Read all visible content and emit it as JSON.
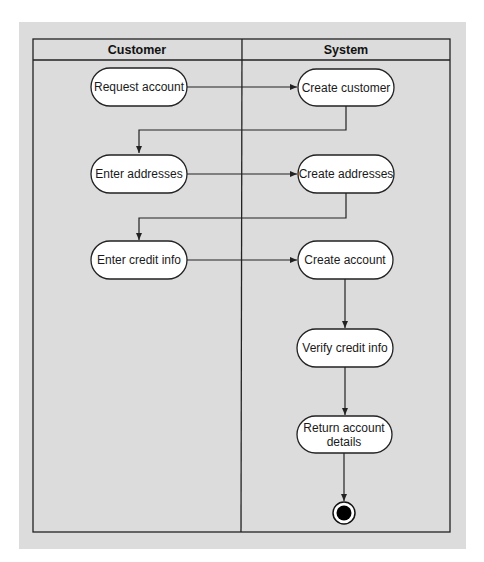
{
  "diagram": {
    "type": "UML activity diagram (swimlanes)",
    "colors": {
      "background": "#dcdcdc",
      "line": "#222222",
      "node_fill": "#ffffff",
      "final_node": "#000000"
    },
    "lanes": [
      {
        "id": "customer",
        "title": "Customer"
      },
      {
        "id": "system",
        "title": "System"
      }
    ],
    "nodes": [
      {
        "id": "request_account",
        "lane": "customer",
        "lines": [
          "Request account"
        ]
      },
      {
        "id": "create_customer",
        "lane": "system",
        "lines": [
          "Create customer"
        ]
      },
      {
        "id": "enter_addresses",
        "lane": "customer",
        "lines": [
          "Enter addresses"
        ]
      },
      {
        "id": "create_addresses",
        "lane": "system",
        "lines": [
          "Create addresses"
        ]
      },
      {
        "id": "enter_credit_info",
        "lane": "customer",
        "lines": [
          "Enter credit info"
        ]
      },
      {
        "id": "create_account",
        "lane": "system",
        "lines": [
          "Create account"
        ]
      },
      {
        "id": "verify_credit_info",
        "lane": "system",
        "lines": [
          "Verify credit info"
        ]
      },
      {
        "id": "return_account_details",
        "lane": "system",
        "lines": [
          "Return account",
          "details"
        ]
      },
      {
        "id": "final",
        "lane": "system",
        "type": "final-node"
      }
    ],
    "edges": [
      [
        "request_account",
        "create_customer"
      ],
      [
        "create_customer",
        "enter_addresses"
      ],
      [
        "enter_addresses",
        "create_addresses"
      ],
      [
        "create_addresses",
        "enter_credit_info"
      ],
      [
        "enter_credit_info",
        "create_account"
      ],
      [
        "create_account",
        "verify_credit_info"
      ],
      [
        "verify_credit_info",
        "return_account_details"
      ],
      [
        "return_account_details",
        "final"
      ]
    ]
  }
}
